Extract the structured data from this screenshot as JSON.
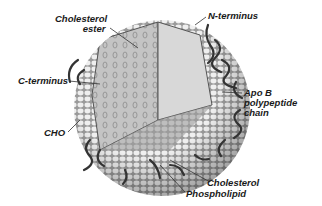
{
  "diagram": {
    "labels": {
      "cholesterol_ester_1": "Cholesterol",
      "cholesterol_ester_2": "ester",
      "n_terminus": "N-terminus",
      "c_terminus": "C-terminus",
      "apo_b_1": "Apo B",
      "apo_b_2": "polypeptide",
      "apo_b_3": "chain",
      "cho": "CHO",
      "cholesterol": "Cholesterol",
      "phospholipid": "Phospholipid"
    },
    "colors": {
      "shell": "#d9d9d9",
      "shell_cells": "#f2f2f2",
      "core": "#bdbdbd",
      "protein_chain": "#3a3a3a",
      "text": "#1a1a1a"
    }
  }
}
